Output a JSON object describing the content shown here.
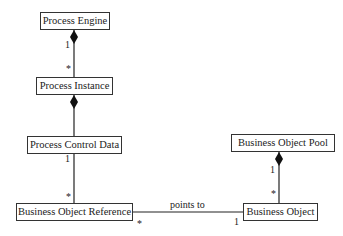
{
  "classes": {
    "process_engine": "Process Engine",
    "process_instance": "Process Instance",
    "process_control_data": "Process Control Data",
    "business_object_reference": "Business Object Reference",
    "business_object_pool": "Business Object Pool",
    "business_object": "Business Object"
  },
  "associations": {
    "engine_instance": {
      "source_mult": "1",
      "target_mult": "*",
      "kind": "composition"
    },
    "instance_control": {
      "kind": "composition"
    },
    "control_reference": {
      "source_mult": "1",
      "target_mult": "*"
    },
    "reference_object": {
      "label": "points to",
      "source_mult": "*",
      "target_mult": "1"
    },
    "pool_object": {
      "source_mult": "1",
      "target_mult": "*",
      "kind": "composition"
    }
  },
  "colors": {
    "line": "#222222",
    "box_border": "#333333",
    "background": "#ffffff"
  }
}
